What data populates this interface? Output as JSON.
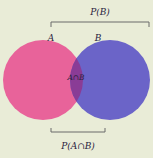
{
  "diagram": {
    "type": "venn",
    "sets": [
      {
        "label": "A",
        "color": "#e8639a"
      },
      {
        "label": "B",
        "color": "#6b64c8"
      }
    ],
    "intersection": {
      "label": "A∩B",
      "color": "#8a3c96"
    },
    "brackets": {
      "top": "P(B)",
      "bottom": "P(A∩B)"
    },
    "background": "#e9ecd7"
  }
}
